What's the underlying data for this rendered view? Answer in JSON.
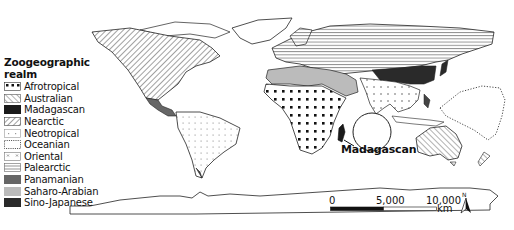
{
  "legend": {
    "title": "Zoogeographic realm",
    "items": [
      {
        "label": "Afrotropical",
        "pattern": "large-dots",
        "color": "#111111"
      },
      {
        "label": "Australian",
        "pattern": "diagonal-hatch-forward",
        "color": "#555555"
      },
      {
        "label": "Madagascan",
        "pattern": "solid",
        "color": "#1a1a1a"
      },
      {
        "label": "Nearctic",
        "pattern": "diagonal-hatch-back",
        "color": "#444444"
      },
      {
        "label": "Neotropical",
        "pattern": "small-plus-dots",
        "color": "#999999"
      },
      {
        "label": "Oceanian",
        "pattern": "dotted-outline",
        "color": "#333333"
      },
      {
        "label": "Oriental",
        "pattern": "small-crosses",
        "color": "#888888"
      },
      {
        "label": "Palearctic",
        "pattern": "horizontal-lines",
        "color": "#666666"
      },
      {
        "label": "Panamanian",
        "pattern": "solid",
        "color": "#666666"
      },
      {
        "label": "Saharo-Arabian",
        "pattern": "solid",
        "color": "#bbbbbb"
      },
      {
        "label": "Sino-Japanese",
        "pattern": "solid",
        "color": "#2a2a2a"
      }
    ]
  },
  "annotation": {
    "label": "Madagascan"
  },
  "scale_bar": {
    "ticks": [
      "0",
      "5,000",
      "10,000"
    ],
    "unit": "km"
  },
  "north_arrow": {
    "label": "N"
  }
}
